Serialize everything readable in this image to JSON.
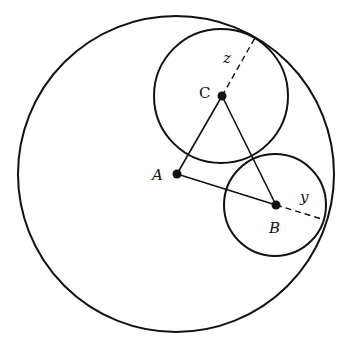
{
  "diagram": {
    "stroke_color": "#111111",
    "background": "#ffffff",
    "big_circle": {
      "cx": 176,
      "cy": 174,
      "r": 158
    },
    "circle_c": {
      "cx": 221,
      "cy": 96,
      "r": 67
    },
    "circle_b": {
      "cx": 275,
      "cy": 205,
      "r": 51
    },
    "points": {
      "A": {
        "label": "A",
        "x": 177,
        "y": 174
      },
      "B": {
        "label": "B",
        "x": 276,
        "y": 205
      },
      "C": {
        "label": "C",
        "x": 222,
        "y": 96
      }
    },
    "segments": [
      {
        "from": "A",
        "to": "B"
      },
      {
        "from": "A",
        "to": "C"
      },
      {
        "from": "B",
        "to": "C"
      }
    ],
    "radius_labels": {
      "z": {
        "label": "z"
      },
      "y": {
        "label": "y"
      }
    }
  }
}
